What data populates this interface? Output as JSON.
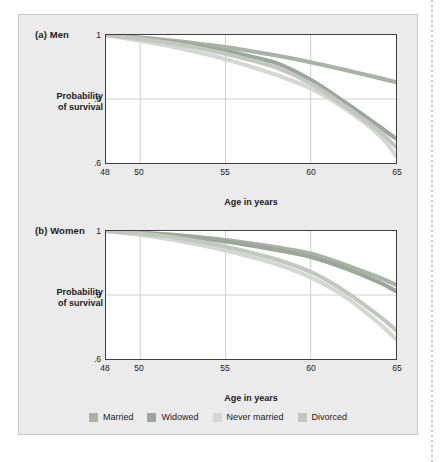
{
  "figure": {
    "panels": [
      {
        "id": "men",
        "title": "(a) Men",
        "ylabel_line1": "Probability",
        "ylabel_line2": "of survival",
        "xlabel": "Age in years"
      },
      {
        "id": "women",
        "title": "(b) Women",
        "ylabel_line1": "Probability",
        "ylabel_line2": "of survival",
        "xlabel": "Age in years"
      }
    ],
    "legend": {
      "items": [
        {
          "label": "Married",
          "color": "#a8b3a4"
        },
        {
          "label": "Widowed",
          "color": "#9aa79a"
        },
        {
          "label": "Never married",
          "color": "#d4d8d2"
        },
        {
          "label": "Divorced",
          "color": "#c2c7c0"
        }
      ]
    }
  },
  "chart_data": [
    {
      "type": "line",
      "title": "(a) Men",
      "xlabel": "Age in years",
      "ylabel": "Probability of survival",
      "xlim": [
        48,
        65
      ],
      "ylim": [
        0.6,
        1.0
      ],
      "xticks": [
        48,
        50,
        55,
        60,
        65
      ],
      "yticks": [
        0.6,
        0.8,
        1.0
      ],
      "ytick_labels": [
        ".6",
        ".8",
        "1"
      ],
      "xtick_labels": [
        "48",
        "50",
        "55",
        "60",
        "65"
      ],
      "grid": "gridlines at x=50,55,60 and y=0.8",
      "legend_position": "below both panels, shared",
      "x": [
        48,
        50,
        52,
        54,
        55,
        56,
        58,
        60,
        62,
        64,
        65
      ],
      "series": [
        {
          "name": "Married",
          "color": "#a8b3a4",
          "values": [
            1.0,
            0.992,
            0.982,
            0.969,
            0.962,
            0.954,
            0.936,
            0.915,
            0.891,
            0.866,
            0.852
          ]
        },
        {
          "name": "Widowed",
          "color": "#9aa79a",
          "values": [
            1.0,
            0.99,
            0.977,
            0.96,
            0.95,
            0.939,
            0.912,
            0.86,
            0.79,
            0.715,
            0.676
          ]
        },
        {
          "name": "Never married",
          "color": "#d4d8d2",
          "values": [
            1.0,
            0.982,
            0.962,
            0.938,
            0.924,
            0.909,
            0.875,
            0.833,
            0.77,
            0.688,
            0.622
          ]
        },
        {
          "name": "Divorced",
          "color": "#c2c7c0",
          "values": [
            1.0,
            0.988,
            0.973,
            0.953,
            0.941,
            0.928,
            0.898,
            0.848,
            0.778,
            0.7,
            0.65
          ]
        }
      ]
    },
    {
      "type": "line",
      "title": "(b) Women",
      "xlabel": "Age in years",
      "ylabel": "Probability of survival",
      "xlim": [
        48,
        65
      ],
      "ylim": [
        0.6,
        1.0
      ],
      "xticks": [
        48,
        50,
        55,
        60,
        65
      ],
      "yticks": [
        0.6,
        0.8,
        1.0
      ],
      "ytick_labels": [
        ".6",
        ".8",
        "1"
      ],
      "xtick_labels": [
        "48",
        "50",
        "55",
        "60",
        "65"
      ],
      "grid": "gridlines at x=50,55,60 and y=0.8",
      "legend_position": "below both panels, shared",
      "x": [
        48,
        50,
        52,
        54,
        55,
        56,
        58,
        60,
        62,
        64,
        65
      ],
      "series": [
        {
          "name": "Married",
          "color": "#a8b3a4",
          "values": [
            1.0,
            0.995,
            0.988,
            0.978,
            0.972,
            0.965,
            0.949,
            0.93,
            0.895,
            0.855,
            0.832
          ]
        },
        {
          "name": "Widowed",
          "color": "#9aa79a",
          "values": [
            1.0,
            0.994,
            0.986,
            0.974,
            0.967,
            0.959,
            0.941,
            0.919,
            0.884,
            0.84,
            0.812
          ]
        },
        {
          "name": "Never married",
          "color": "#d4d8d2",
          "values": [
            1.0,
            0.988,
            0.972,
            0.951,
            0.939,
            0.926,
            0.896,
            0.855,
            0.795,
            0.712,
            0.662
          ]
        },
        {
          "name": "Divorced",
          "color": "#c2c7c0",
          "values": [
            1.0,
            0.992,
            0.98,
            0.962,
            0.951,
            0.939,
            0.911,
            0.872,
            0.812,
            0.735,
            0.69
          ]
        }
      ]
    }
  ]
}
